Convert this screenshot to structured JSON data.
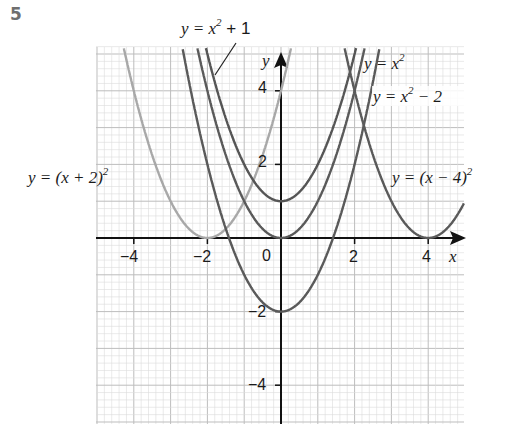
{
  "question_number": "5",
  "chart_data": {
    "type": "line",
    "title": "",
    "xlabel": "x",
    "ylabel": "y",
    "xlim": [
      -5,
      5
    ],
    "ylim": [
      -5.1,
      5.2
    ],
    "x_ticks": [
      -4,
      -2,
      0,
      2,
      4
    ],
    "y_ticks": [
      -4,
      -2,
      2,
      4
    ],
    "x_tick_labels": [
      "−4",
      "−2",
      "0",
      "2",
      "4"
    ],
    "y_tick_labels": [
      "−4",
      "−2",
      "2",
      "4"
    ],
    "grid": true,
    "series": [
      {
        "name": "y = (x + 2)²",
        "formula": "(x+2)^2",
        "vertex": [
          -2,
          0
        ],
        "color": "#a8a8a8",
        "x": [
          -4.3,
          -4,
          -3,
          -2,
          -1,
          0,
          0.2
        ],
        "values": [
          5.29,
          4,
          1,
          0,
          1,
          4,
          4.84
        ]
      },
      {
        "name": "y = x² + 1",
        "formula": "x^2+1",
        "vertex": [
          0,
          1
        ],
        "color": "#555555",
        "x": [
          -2.1,
          -2,
          -1,
          0,
          1,
          2,
          2.1
        ],
        "values": [
          5.41,
          5,
          2,
          1,
          2,
          5,
          5.41
        ]
      },
      {
        "name": "y = x²",
        "formula": "x^2",
        "vertex": [
          0,
          0
        ],
        "color": "#5a5a5a",
        "x": [
          -2.3,
          -2,
          -1,
          0,
          1,
          2,
          2.3
        ],
        "values": [
          5.29,
          4,
          1,
          0,
          1,
          4,
          5.29
        ]
      },
      {
        "name": "y = x² − 2",
        "formula": "x^2-2",
        "vertex": [
          0,
          -2
        ],
        "color": "#5a5a5a",
        "x": [
          -2.6,
          -2,
          -1,
          0,
          1,
          2,
          2.6
        ],
        "values": [
          4.76,
          2,
          -1,
          -2,
          -1,
          2,
          4.76
        ]
      },
      {
        "name": "y = (x − 4)²",
        "formula": "(x-4)^2",
        "vertex": [
          4,
          0
        ],
        "color": "#5a5a5a",
        "x": [
          1.8,
          2,
          3,
          4,
          5
        ],
        "values": [
          4.84,
          4,
          1,
          0,
          1
        ]
      }
    ],
    "annotations": [
      {
        "text": "y = x² + 1",
        "points_to": "y = x² + 1"
      },
      {
        "text": "y = x²",
        "position": "top-right"
      },
      {
        "text": "y = x² − 2",
        "position": "right"
      },
      {
        "text": "y = (x + 2)²",
        "position": "left"
      },
      {
        "text": "y = (x − 4)²",
        "position": "right"
      }
    ]
  },
  "labels": {
    "x_axis": "x",
    "y_axis": "y",
    "origin": "0",
    "curve_a_pre": "y = (x + 2)",
    "curve_b_pre": "y = x",
    "curve_b_post": " + 1",
    "curve_c_pre": "y = x",
    "curve_d_pre": "y = x",
    "curve_d_post": " − 2",
    "curve_e_pre": "y = (x − 4)",
    "sup2": "2"
  }
}
